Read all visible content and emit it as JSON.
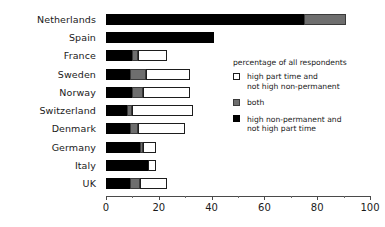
{
  "chart_data": {
    "type": "bar",
    "orientation": "horizontal",
    "stacked": true,
    "title": "",
    "xlabel": "percentage of all respondents",
    "ylabel": "",
    "xlim": [
      0,
      100
    ],
    "xticks": [
      0,
      20,
      40,
      60,
      80,
      100
    ],
    "xtick_labels": [
      "0",
      "20",
      "40",
      "60",
      "80",
      "100"
    ],
    "grid": false,
    "legend_position": "right",
    "categories": [
      "Netherlands",
      "Spain",
      "France",
      "Sweden",
      "Norway",
      "Switzerland",
      "Denmark",
      "Germany",
      "Italy",
      "UK"
    ],
    "series": [
      {
        "name": "high non-permanent and not high part time",
        "color": "#000000",
        "values": [
          75,
          41,
          10,
          9,
          10,
          8,
          9,
          13,
          16,
          9
        ]
      },
      {
        "name": "both",
        "color": "#6e6e6e",
        "values": [
          16,
          0,
          2,
          6,
          4,
          2,
          3,
          1,
          0,
          4
        ]
      },
      {
        "name": "high part time and not high non-permanent",
        "color": "#ffffff",
        "values": [
          0,
          0,
          11,
          17,
          18,
          23,
          18,
          5,
          3,
          10
        ]
      }
    ],
    "totals": [
      91,
      41,
      23,
      32,
      32,
      33,
      30,
      19,
      19,
      23
    ]
  },
  "legend": {
    "title": "percentage of all respondents",
    "items": [
      {
        "swatch": "white",
        "line1": "high part time and",
        "line2": "not high non-permanent"
      },
      {
        "swatch": "gray",
        "line1": "both",
        "line2": ""
      },
      {
        "swatch": "black",
        "line1": "high non-permanent and",
        "line2": "not high part time"
      }
    ]
  }
}
